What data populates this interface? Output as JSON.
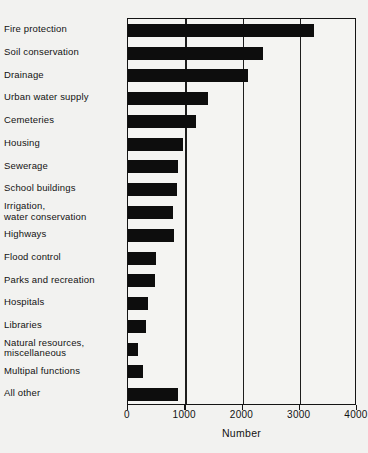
{
  "chart_data": {
    "type": "bar",
    "orientation": "horizontal",
    "title": "",
    "xlabel": "Number",
    "ylabel": "",
    "xlim": [
      0,
      4000
    ],
    "xticks": [
      0,
      1000,
      2000,
      3000,
      4000
    ],
    "xtick_labels": [
      "0",
      "1000",
      "2000",
      "3000",
      "4000"
    ],
    "grid": "vertical",
    "legend": "none",
    "bar_color": "#0d0d0d",
    "categories": [
      "Fire protection",
      "Soil conservation",
      "Drainage",
      "Urban water supply",
      "Cemeteries",
      "Housing",
      "Sewerage",
      "School buildings",
      "Irrigation,\n  water conservation",
      "Highways",
      "Flood control",
      "Parks and recreation",
      "Hospitals",
      "Libraries",
      "Natural resources,\n  miscellaneous",
      "Multipal functions",
      "All other"
    ],
    "values": [
      3250,
      2350,
      2100,
      1400,
      1180,
      960,
      880,
      860,
      790,
      800,
      490,
      470,
      350,
      320,
      180,
      260,
      880
    ]
  },
  "axis": {
    "x_title": "Number"
  }
}
